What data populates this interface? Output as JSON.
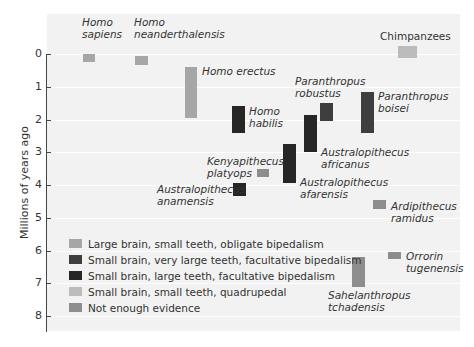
{
  "chart_data": {
    "type": "bar",
    "subtype": "floating-range",
    "title": "",
    "ylabel": "Millions of years ago",
    "xlabel": "",
    "ylim": [
      0,
      8
    ],
    "yticks": [
      0,
      1,
      2,
      3,
      4,
      5,
      6,
      7,
      8
    ],
    "y_inverted": true,
    "grid": true,
    "legend_position": "lower-left",
    "legend": [
      {
        "key": "A",
        "label": "Large brain, small teeth, obligate bipedalism",
        "color": "#a6a6a6"
      },
      {
        "key": "B",
        "label": "Small brain, very large teeth, facultative bipedalism",
        "color": "#3e3e3e"
      },
      {
        "key": "C",
        "label": "Small brain, large teeth, facultative bipedalism",
        "color": "#262626"
      },
      {
        "key": "D",
        "label": "Small brain, small teeth, quadrupedal",
        "color": "#bcbcbc"
      },
      {
        "key": "E",
        "label": "Not enough evidence",
        "color": "#8d8d8d"
      }
    ],
    "series": [
      {
        "name": "Homo sapiens",
        "label_lines": [
          "Homo",
          "sapiens"
        ],
        "category": "A",
        "start": 0.0,
        "end": 0.25
      },
      {
        "name": "Homo neanderthalensis",
        "label_lines": [
          "Homo",
          "neanderthalensis"
        ],
        "category": "A",
        "start": 0.05,
        "end": 0.35
      },
      {
        "name": "Homo erectus",
        "label_lines": [
          "Homo erectus"
        ],
        "category": "A",
        "start": 0.4,
        "end": 1.95
      },
      {
        "name": "Homo habilis",
        "label_lines": [
          "Homo",
          "habilis"
        ],
        "category": "C",
        "start": 1.6,
        "end": 2.4
      },
      {
        "name": "Paranthropus robustus",
        "label_lines": [
          "Paranthropus",
          "robustus"
        ],
        "category": "B",
        "start": 1.5,
        "end": 2.05
      },
      {
        "name": "Australopithecus africanus",
        "label_lines": [
          "Australopithecus",
          "africanus"
        ],
        "category": "C",
        "start": 1.85,
        "end": 3.0
      },
      {
        "name": "Paranthropus boisei",
        "label_lines": [
          "Paranthropus",
          "boisei"
        ],
        "category": "B",
        "start": 1.15,
        "end": 2.4
      },
      {
        "name": "Australopithecus afarensis",
        "label_lines": [
          "Australopithecus",
          "afarensis"
        ],
        "category": "C",
        "start": 2.75,
        "end": 3.95
      },
      {
        "name": "Kenyapithecus platyops",
        "label_lines": [
          "Kenyapithecus",
          "platyops"
        ],
        "category": "E",
        "start": 3.5,
        "end": 3.75
      },
      {
        "name": "Australopithecus anamensis",
        "label_lines": [
          "Australopithecus",
          "anamensis"
        ],
        "category": "C",
        "start": 3.95,
        "end": 4.35
      },
      {
        "name": "Ardipithecus ramidus",
        "label_lines": [
          "Ardipithecus",
          "ramidus"
        ],
        "category": "E",
        "start": 4.45,
        "end": 4.72
      },
      {
        "name": "Orrorin tugenensis",
        "label_lines": [
          "Orrorin",
          "tugenensis"
        ],
        "category": "E",
        "start": 6.05,
        "end": 6.25
      },
      {
        "name": "Sahelanthropus tchadensis",
        "label_lines": [
          "Sahelanthropus",
          "tchadensis"
        ],
        "category": "E",
        "start": 6.2,
        "end": 7.1
      },
      {
        "name": "Chimpanzees",
        "label_lines": [
          "Chimpanzees"
        ],
        "category": "D",
        "start": -0.25,
        "end": 0.12
      }
    ]
  }
}
